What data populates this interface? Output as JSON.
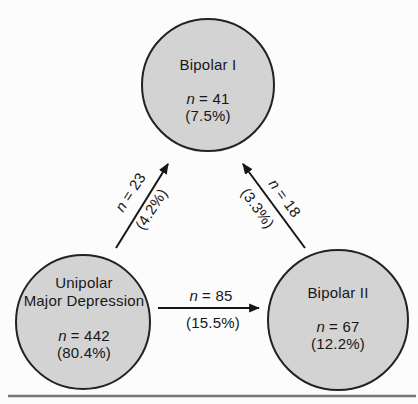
{
  "figure_name": "Diagnostic flow diagram: unipolar major depression converting to bipolar disorders",
  "nodes": {
    "bipolar1": {
      "label": "Bipolar I",
      "n_var": "n",
      "n_rest": "= 41",
      "pct": "(7.5%)"
    },
    "unipolar": {
      "label_line1": "Unipolar",
      "label_line2": "Major Depression",
      "n_var": "n",
      "n_rest": "= 442",
      "pct": "(80.4%)"
    },
    "bipolar2": {
      "label": "Bipolar II",
      "n_var": "n",
      "n_rest": "= 67",
      "pct": "(12.2%)"
    }
  },
  "edges": {
    "unipolar_to_bipolar1": {
      "from": "Unipolar Major Depression",
      "to": "Bipolar I",
      "n_var": "n",
      "n_rest": "= 23",
      "pct": "(4.2%)"
    },
    "bipolar2_to_bipolar1": {
      "from": "Bipolar II",
      "to": "Bipolar I",
      "n_var": "n",
      "n_rest": "= 18",
      "pct": "(3.3%)"
    },
    "unipolar_to_bipolar2": {
      "from": "Unipolar Major Depression",
      "to": "Bipolar II",
      "n_var": "n",
      "n_rest": "= 85",
      "pct": "(15.5%)"
    }
  },
  "colors": {
    "background": "#fcfcfc",
    "node_fill": "#d3d3d3",
    "node_stroke": "#222222",
    "arrow": "#161616",
    "rule": "#757575",
    "text": "#171717"
  }
}
